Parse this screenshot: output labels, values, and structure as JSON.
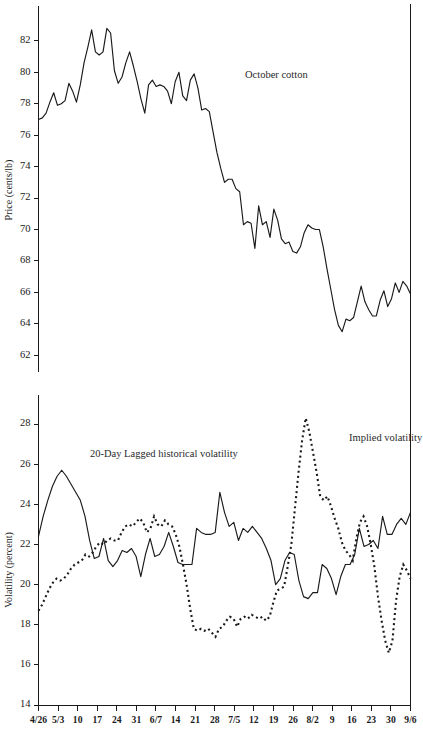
{
  "chart_data": [
    {
      "type": "line",
      "id": "price-panel",
      "title": "",
      "xlabel": "",
      "ylabel": "Price (cents/lb)",
      "ylim": [
        61,
        83.2
      ],
      "yticks": [
        62,
        64,
        66,
        68,
        70,
        72,
        74,
        76,
        78,
        80,
        82
      ],
      "grid": false,
      "legend_position": "inline-annotation",
      "annotations": [
        {
          "text": "October cotton",
          "x_index": 55,
          "value": 79.6
        }
      ],
      "x": [
        "4/26",
        "5/3",
        "10",
        "17",
        "24",
        "31",
        "6/7",
        "14",
        "21",
        "28",
        "7/5",
        "12",
        "19",
        "26",
        "8/2",
        "9",
        "16",
        "23",
        "30",
        "9/6"
      ],
      "xticks": [
        "4/26",
        "5/3",
        "10",
        "17",
        "24",
        "31",
        "6/7",
        "14",
        "21",
        "28",
        "7/5",
        "12",
        "19",
        "26",
        "8/2",
        "9",
        "16",
        "23",
        "30",
        "9/6"
      ],
      "series": [
        {
          "name": "October cotton",
          "style": "solid",
          "values": [
            77.0,
            77.1,
            77.4,
            78.1,
            78.7,
            77.9,
            78.0,
            78.2,
            79.3,
            78.8,
            78.1,
            79.2,
            80.6,
            81.6,
            82.7,
            81.3,
            81.1,
            81.3,
            82.8,
            82.5,
            80.1,
            79.3,
            79.7,
            80.6,
            81.3,
            80.4,
            79.4,
            78.3,
            77.4,
            79.2,
            79.5,
            79.1,
            79.2,
            79.1,
            78.8,
            78.0,
            79.4,
            80.0,
            78.5,
            78.2,
            79.5,
            79.9,
            79.0,
            77.6,
            77.7,
            77.5,
            76.2,
            74.9,
            73.9,
            73.0,
            73.2,
            73.2,
            72.6,
            72.4,
            70.3,
            70.5,
            70.4,
            68.8,
            71.5,
            70.3,
            70.5,
            69.5,
            71.3,
            70.6,
            69.4,
            69.1,
            69.2,
            68.6,
            68.5,
            68.9,
            69.8,
            70.3,
            70.1,
            70.0,
            70.0,
            68.9,
            67.5,
            66.2,
            64.9,
            63.9,
            63.5,
            64.3,
            64.2,
            64.4,
            65.4,
            66.4,
            65.4,
            64.9,
            64.5,
            64.5,
            65.5,
            66.1,
            65.1,
            65.6,
            66.6,
            66.0,
            66.7,
            66.4,
            65.9
          ]
        }
      ]
    },
    {
      "type": "line",
      "id": "volatility-panel",
      "title": "",
      "xlabel": "",
      "ylabel": "Volatility (percent)",
      "ylim": [
        14,
        29.2
      ],
      "yticks": [
        14,
        16,
        18,
        20,
        22,
        24,
        26,
        28
      ],
      "grid": false,
      "legend_position": "inline-annotation",
      "annotations": [
        {
          "text": "20-Day Lagged historical volatility",
          "x_index": 17,
          "value": 26.2
        },
        {
          "text": "Implied volatility",
          "x_index": 76,
          "value": 26.7
        }
      ],
      "x": [
        "4/26",
        "5/3",
        "10",
        "17",
        "24",
        "31",
        "6/7",
        "14",
        "21",
        "28",
        "7/5",
        "12",
        "19",
        "26",
        "8/2",
        "9",
        "16",
        "23",
        "30",
        "9/6"
      ],
      "xticks": [
        "4/26",
        "5/3",
        "10",
        "17",
        "24",
        "31",
        "6/7",
        "14",
        "21",
        "28",
        "7/5",
        "12",
        "19",
        "26",
        "8/2",
        "9",
        "16",
        "23",
        "30",
        "9/6"
      ],
      "series": [
        {
          "name": "20-Day Lagged historical volatility",
          "style": "solid",
          "values": [
            22.4,
            23.4,
            24.2,
            24.9,
            25.4,
            25.7,
            25.4,
            25.0,
            24.6,
            24.2,
            23.4,
            22.2,
            21.3,
            21.4,
            22.3,
            21.2,
            20.9,
            21.2,
            21.7,
            21.6,
            21.8,
            21.4,
            20.4,
            21.5,
            22.3,
            21.4,
            21.5,
            21.9,
            22.6,
            21.9,
            21.1,
            21.0,
            21.0,
            21.0,
            22.8,
            22.6,
            22.5,
            22.5,
            22.6,
            24.6,
            23.6,
            22.9,
            23.1,
            22.2,
            22.8,
            22.6,
            22.9,
            22.6,
            22.3,
            21.8,
            21.2,
            20.0,
            20.3,
            21.2,
            21.6,
            21.5,
            20.2,
            19.4,
            19.3,
            19.6,
            19.6,
            21.0,
            20.8,
            20.3,
            19.5,
            20.4,
            21.0,
            21.0,
            21.5,
            22.8,
            21.9,
            22.0,
            22.2,
            21.8,
            23.4,
            22.5,
            22.5,
            23.0,
            23.3,
            23.0,
            23.6
          ]
        },
        {
          "name": "Implied volatility",
          "style": "dotted",
          "values": [
            18.7,
            19.0,
            19.4,
            19.8,
            20.1,
            20.3,
            20.2,
            20.3,
            20.5,
            20.8,
            21.0,
            21.1,
            21.2,
            21.5,
            21.4,
            21.6,
            21.9,
            22.1,
            22.0,
            22.2,
            22.3,
            22.2,
            22.2,
            22.6,
            22.9,
            23.0,
            22.9,
            23.1,
            23.3,
            23.1,
            22.6,
            22.8,
            23.4,
            23.0,
            22.9,
            23.2,
            23.0,
            22.9,
            22.5,
            21.9,
            21.0,
            20.0,
            18.8,
            17.8,
            17.7,
            17.8,
            17.7,
            17.8,
            17.6,
            17.4,
            17.8,
            17.9,
            18.2,
            18.4,
            18.3,
            17.9,
            18.3,
            18.4,
            18.3,
            18.5,
            18.4,
            18.3,
            18.4,
            18.2,
            18.4,
            19.1,
            19.7,
            19.8,
            19.9,
            20.9,
            22.0,
            23.8,
            25.6,
            27.2,
            28.3,
            27.6,
            26.6,
            25.6,
            24.4,
            24.2,
            24.4,
            23.9,
            23.3,
            22.8,
            22.1,
            21.7,
            21.5,
            21.2,
            22.3,
            23.1,
            23.4,
            22.9,
            22.0,
            20.9,
            19.4,
            18.2,
            17.2,
            16.6,
            17.2,
            19.2,
            20.4,
            21.0,
            20.7,
            20.3
          ]
        }
      ]
    }
  ],
  "labels": {
    "price_axis_title": "Price (cents/lb)",
    "volatility_axis_title": "Volatility (percent)",
    "october_cotton": "October cotton",
    "historical_volatility": "20-Day Lagged historical volatility",
    "implied_volatility": "Implied volatility"
  },
  "colors": {
    "ink": "#1a1a1a",
    "background": "#ffffff"
  }
}
